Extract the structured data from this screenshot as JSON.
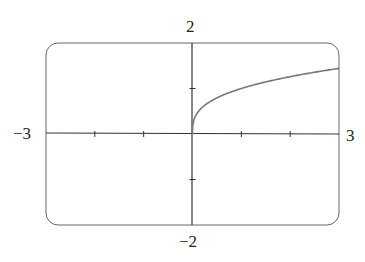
{
  "chart_data": {
    "type": "line",
    "title": "",
    "xlabel": "",
    "ylabel": "",
    "xlim": [
      -3,
      3
    ],
    "ylim": [
      -2,
      2
    ],
    "xticks": [
      -3,
      -2,
      -1,
      0,
      1,
      2,
      3
    ],
    "yticks": [
      -2,
      -1,
      0,
      1,
      2
    ],
    "grid": false,
    "series": [
      {
        "name": "y = cube root of x",
        "x": [
          0,
          0.01,
          0.05,
          0.1,
          0.25,
          0.5,
          0.75,
          1,
          1.5,
          2,
          2.5,
          3
        ],
        "y": [
          0,
          0.215,
          0.368,
          0.464,
          0.63,
          0.794,
          0.909,
          1.0,
          1.145,
          1.26,
          1.357,
          1.442
        ]
      }
    ],
    "axis_labels": {
      "x_min": "−3",
      "x_max": "3",
      "y_min": "−2",
      "y_max": "2"
    },
    "colors": {
      "curve": "#777777",
      "axes": "#333333",
      "frame": "#555555"
    }
  }
}
